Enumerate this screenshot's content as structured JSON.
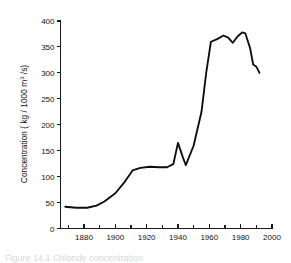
{
  "figure": {
    "caption_fragment": "Figure  14.1  Chloride concentration"
  },
  "chart_data": {
    "type": "line",
    "title": "",
    "xlabel": "",
    "ylabel": "Concentration ( kg / 1000 m³ /s)",
    "ylabel_parts": {
      "prefix": "Concentration ( kg / 1000 m",
      "superscript": "3",
      "suffix": " /s)"
    },
    "xlim": [
      1865,
      2000
    ],
    "ylim": [
      0,
      400
    ],
    "grid": false,
    "legend": false,
    "x_ticks_major": [
      1880,
      1900,
      1920,
      1940,
      1960,
      1980,
      2000
    ],
    "x_tick_labels": [
      "1880",
      "1900",
      "1920",
      "1940",
      "1960",
      "1980",
      "2000"
    ],
    "x_ticks_minor": [
      1870,
      1890,
      1910,
      1930,
      1950,
      1970,
      1990
    ],
    "y_ticks": [
      0,
      50,
      100,
      150,
      200,
      250,
      300,
      350,
      400
    ],
    "y_tick_labels": [
      "0",
      "50",
      "100",
      "150",
      "200",
      "250",
      "300",
      "350",
      "400"
    ],
    "series": [
      {
        "name": "Concentration",
        "color": "#0d0d0d",
        "x": [
          1868,
          1875,
          1882,
          1888,
          1893,
          1900,
          1906,
          1911,
          1916,
          1922,
          1928,
          1933,
          1937,
          1940,
          1943,
          1945,
          1950,
          1955,
          1958,
          1961,
          1965,
          1969,
          1972,
          1975,
          1978,
          1981,
          1983,
          1986,
          1988,
          1990,
          1992
        ],
        "y": [
          42,
          40,
          40,
          44,
          52,
          68,
          90,
          112,
          117,
          119,
          118,
          118,
          124,
          165,
          138,
          122,
          160,
          225,
          300,
          360,
          365,
          372,
          368,
          358,
          370,
          378,
          376,
          348,
          316,
          312,
          300
        ]
      }
    ]
  }
}
